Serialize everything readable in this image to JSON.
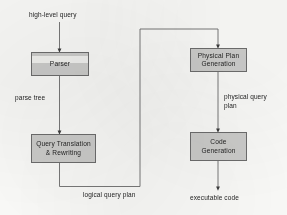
{
  "diagram": {
    "background_color": "#fbfbf9",
    "node_fill_color": "#cdcdcb",
    "node_border_color": "#6d6d6d",
    "line_color": "#5a5a5a",
    "nodes": [
      {
        "id": "parser",
        "label": "Parser"
      },
      {
        "id": "query-translation-rewriting",
        "label": "Query Translation\n& Rewriting"
      },
      {
        "id": "physical-plan-generation",
        "label": "Physical  Plan\nGeneration"
      },
      {
        "id": "code-generation",
        "label": "Code\nGeneration"
      }
    ],
    "edge_labels": [
      {
        "id": "high-level-query",
        "text": "high-level query"
      },
      {
        "id": "parse-tree",
        "text": "parse tree"
      },
      {
        "id": "logical-query-plan",
        "text": "logical query plan"
      },
      {
        "id": "physical-query-plan",
        "text": "physical query\nplan"
      },
      {
        "id": "executable-code",
        "text": "executable code"
      }
    ]
  }
}
